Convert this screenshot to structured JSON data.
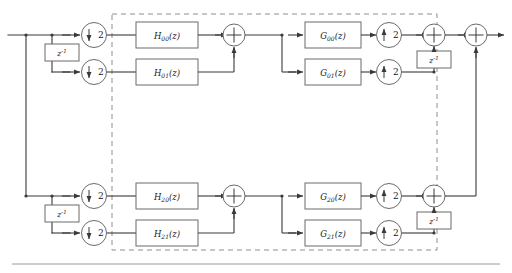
{
  "diagram": {
    "colors": {
      "line": "#3a3a3a",
      "box_stroke": "#6b6b6b",
      "dashed_stroke": "#8f8f8f",
      "text": "#1a1a1a",
      "background": "#ffffff",
      "footer_rule": "#9a9a9a"
    },
    "dashed_region": {
      "label": ""
    },
    "delays": [
      {
        "id": "delay-analysis-top",
        "base": "z",
        "exponent": "-1"
      },
      {
        "id": "delay-analysis-bottom",
        "base": "z",
        "exponent": "-1"
      },
      {
        "id": "delay-synthesis-top",
        "base": "z",
        "exponent": "-1"
      },
      {
        "id": "delay-synthesis-bottom",
        "base": "z",
        "exponent": "-1"
      }
    ],
    "downsamplers": [
      {
        "id": "down-00",
        "arrow": "down",
        "factor": "2"
      },
      {
        "id": "down-01",
        "arrow": "down",
        "factor": "2"
      },
      {
        "id": "down-20",
        "arrow": "down",
        "factor": "2"
      },
      {
        "id": "down-21",
        "arrow": "down",
        "factor": "2"
      }
    ],
    "upsamplers": [
      {
        "id": "up-00",
        "arrow": "up",
        "factor": "2"
      },
      {
        "id": "up-01",
        "arrow": "up",
        "factor": "2"
      },
      {
        "id": "up-20",
        "arrow": "up",
        "factor": "2"
      },
      {
        "id": "up-21",
        "arrow": "up",
        "factor": "2"
      }
    ],
    "analysis_filters": [
      {
        "id": "h00",
        "name": "H",
        "sub": "00",
        "arg": "(z)"
      },
      {
        "id": "h01",
        "name": "H",
        "sub": "01",
        "arg": "(z)"
      },
      {
        "id": "h20",
        "name": "H",
        "sub": "20",
        "arg": "(z)"
      },
      {
        "id": "h21",
        "name": "H",
        "sub": "21",
        "arg": "(z)"
      }
    ],
    "synthesis_filters": [
      {
        "id": "g00",
        "name": "G",
        "sub": "00",
        "arg": "(z)"
      },
      {
        "id": "g01",
        "name": "G",
        "sub": "01",
        "arg": "(z)"
      },
      {
        "id": "g20",
        "name": "G",
        "sub": "20",
        "arg": "(z)"
      },
      {
        "id": "g21",
        "name": "G",
        "sub": "21",
        "arg": "(z)"
      }
    ],
    "adders": [
      {
        "id": "adder-analysis-top",
        "symbol": "+"
      },
      {
        "id": "adder-analysis-bottom",
        "symbol": "+"
      },
      {
        "id": "adder-synthesis-top",
        "symbol": "+"
      },
      {
        "id": "adder-synthesis-bottom",
        "symbol": "+"
      },
      {
        "id": "adder-output",
        "symbol": "+"
      }
    ]
  }
}
